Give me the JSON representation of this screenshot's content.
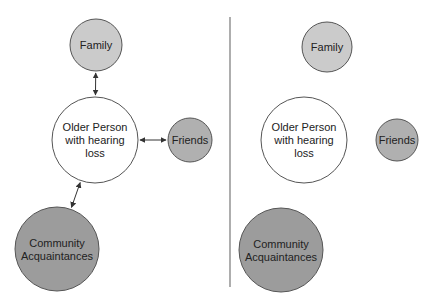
{
  "panels": [
    {
      "id": "connected",
      "nodes": [
        {
          "key": "family",
          "lines": [
            "Family"
          ],
          "cx": 96,
          "cy": 45,
          "r": 26,
          "fill": "#cbcbcb"
        },
        {
          "key": "center",
          "lines": [
            "Older Person",
            "with hearing",
            "loss"
          ],
          "cx": 95,
          "cy": 140,
          "r": 43,
          "fill": "#ffffff"
        },
        {
          "key": "friends",
          "lines": [
            "Friends"
          ],
          "cx": 190,
          "cy": 140,
          "r": 22,
          "fill": "#b0b0b0"
        },
        {
          "key": "community",
          "lines": [
            "Community",
            "Acquaintances"
          ],
          "cx": 57,
          "cy": 249,
          "r": 42,
          "fill": "#9c9c9c"
        }
      ],
      "edges": [
        {
          "from": "family",
          "to": "center",
          "bidirectional": true
        },
        {
          "from": "center",
          "to": "friends",
          "bidirectional": true
        },
        {
          "from": "center",
          "to": "community",
          "bidirectional": true
        }
      ]
    },
    {
      "id": "isolated",
      "nodes": [
        {
          "key": "family",
          "lines": [
            "Family"
          ],
          "cx": 327,
          "cy": 47,
          "r": 25,
          "fill": "#cbcbcb"
        },
        {
          "key": "center",
          "lines": [
            "Older Person",
            "with hearing",
            "loss"
          ],
          "cx": 304,
          "cy": 140,
          "r": 43,
          "fill": "#ffffff"
        },
        {
          "key": "friends",
          "lines": [
            "Friends"
          ],
          "cx": 397,
          "cy": 140,
          "r": 21,
          "fill": "#b0b0b0"
        },
        {
          "key": "community",
          "lines": [
            "Community",
            "Acquaintances"
          ],
          "cx": 281,
          "cy": 250,
          "r": 42,
          "fill": "#9c9c9c"
        }
      ],
      "edges": []
    }
  ],
  "divider": {
    "x": 230,
    "y1": 17,
    "y2": 287,
    "color": "#777777"
  },
  "colors": {
    "stroke": "#555555",
    "arrow": "#333333",
    "text": "#222222"
  }
}
